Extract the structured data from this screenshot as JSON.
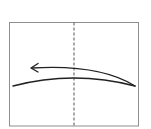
{
  "diagram": {
    "type": "fold-instruction",
    "paper": {
      "x": 9.5,
      "y": 22.5,
      "width": 129,
      "height": 103.5,
      "stroke": "#8f8f8f"
    },
    "fold_line": {
      "style": "dashed",
      "x": 74,
      "y1": 22.5,
      "y2": 126,
      "stroke": "#555555"
    },
    "paper_edge_curve": {
      "path": "M13,86 Q74,70 135,86",
      "stroke": "#222222"
    },
    "fold_arrow": {
      "direction": "left",
      "path": "M135,86 Q100,64 32,68",
      "stroke": "#222222"
    }
  }
}
